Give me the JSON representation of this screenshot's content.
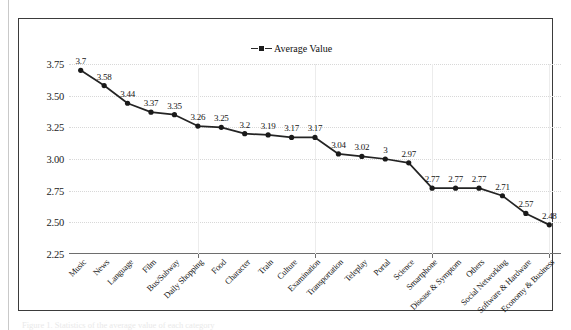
{
  "figure": {
    "caption": "Figure 1. Statistics of the average value of each category"
  },
  "legend": {
    "position": "top-center",
    "entries": [
      {
        "label": "Average Value",
        "marker": "square",
        "line_style": "dashed",
        "color": "#1d1d1d"
      }
    ]
  },
  "chart_data": {
    "type": "line",
    "title": "",
    "xlabel": "",
    "ylabel": "",
    "ylim": [
      2.25,
      3.75
    ],
    "yticks": [
      "2.25",
      "2.50",
      "2.75",
      "3.00",
      "3.25",
      "3.50",
      "3.75"
    ],
    "ytick_values": [
      2.25,
      2.5,
      2.75,
      3.0,
      3.25,
      3.5,
      3.75
    ],
    "grid": "horizontal-dotted-and-vertical-light",
    "legend_position": "top-center",
    "categories": [
      "Music",
      "News",
      "Language",
      "Film",
      "Bus/Subway",
      "Daily Shopping",
      "Food",
      "Character",
      "Train",
      "Culture",
      "Examination",
      "Transportation",
      "Teleplay",
      "Portal",
      "Science",
      "Smartphone",
      "Disease & Symptom",
      "Others",
      "Social Networking",
      "Software & Hardware",
      "Economy & Business"
    ],
    "series": [
      {
        "name": "Average Value",
        "values": [
          3.7,
          3.58,
          3.44,
          3.37,
          3.35,
          3.26,
          3.25,
          3.2,
          3.19,
          3.17,
          3.17,
          3.04,
          3.02,
          3,
          2.97,
          2.77,
          2.77,
          2.77,
          2.71,
          2.57,
          2.48
        ],
        "labels": [
          "3.7",
          "3.58",
          "3.44",
          "3.37",
          "3.35",
          "3.26",
          "3.25",
          "3.2",
          "3.19",
          "3.17",
          "3.17",
          "3.04",
          "3.02",
          "3",
          "2.97",
          "2.77",
          "2.77",
          "2.77",
          "2.71",
          "2.57",
          "2.48"
        ]
      }
    ]
  }
}
